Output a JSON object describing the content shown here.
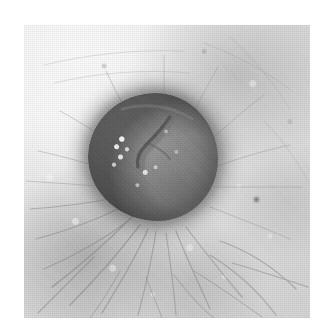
{
  "image": {
    "kind": "clinical-photograph",
    "modality": "grayscale clinical dermatology photograph",
    "subject": "dome-shaped skin nodule (lesion) on hair-bearing skin",
    "orientation": "square photographic print on white paper margin",
    "width_px": 329,
    "height_px": 335,
    "caption": "",
    "labels": [],
    "annotations": [],
    "scale_bar": "",
    "colors": {
      "paper_white": "#ffffff",
      "skin_highlight": "#fdfdfd",
      "skin_midtone": "#e0e0e0",
      "skin_shadow": "#a8a8a8",
      "lesion_light": "#9a9a9a",
      "lesion_mid": "#848484",
      "lesion_dark": "#747474",
      "lesion_rim": "#4b4b4b",
      "crease_dark": "#3f3f3f",
      "hair_dark": "#7a7a7a",
      "keratin_speckle": "#ffffff"
    },
    "photo_frame": {
      "left_px": 24,
      "top_px": 25,
      "width_px": 286,
      "height_px": 293
    },
    "lesion": {
      "name": "central nodule",
      "left_px": 88,
      "top_px": 93,
      "width_px": 130,
      "height_px": 128,
      "shape": "round to slightly oval, dome shaped",
      "surface": "smooth with a dark central crease and scattered white keratin speckles",
      "border": "well defined, darker rim on the right and inferior margin"
    },
    "features": [
      {
        "name": "central-crease",
        "description": "dark diagonal fissure running from upper-right toward the centre of the nodule"
      },
      {
        "name": "keratin-speckles",
        "description": "cluster of bright white pinpoint highlights on the left half of the nodule"
      },
      {
        "name": "peri-lesional-halo",
        "description": "soft grey shadow in the skin immediately surrounding the nodule"
      },
      {
        "name": "radiating-hairs",
        "description": "fine dark hair strands radiating outward, densest in the lower-left quadrant"
      },
      {
        "name": "upper-right-shading",
        "description": "broad diffuse grey tonal blotch in the upper-right skin"
      },
      {
        "name": "skin-dot",
        "description": "small dark punctate dot in the right-hand skin field"
      },
      {
        "name": "print-grain",
        "description": "visible halftone print grain across the whole photograph"
      }
    ]
  }
}
